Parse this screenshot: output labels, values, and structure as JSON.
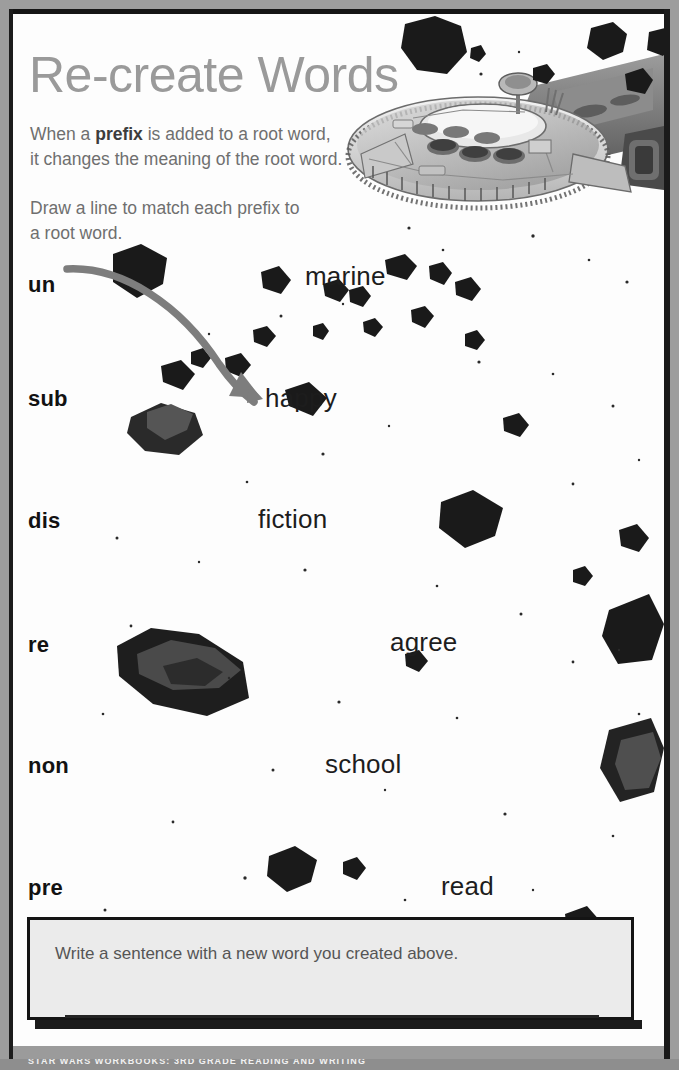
{
  "page": {
    "title": "Re-create Words",
    "intro_line_1": "When a ",
    "intro_bold": "prefix",
    "intro_line_1b": " is added to a root word,\nit changes the meaning of the root word.",
    "intro_line_2": "Draw a line to match each prefix to\na root word.",
    "footer": "STAR WARS WORKBOOKS: 3RD GRADE READING AND WRITING"
  },
  "exercise": {
    "prefixes": [
      {
        "label": "un",
        "top": 258
      },
      {
        "label": "sub",
        "top": 372
      },
      {
        "label": "dis",
        "top": 494
      },
      {
        "label": "re",
        "top": 618
      },
      {
        "label": "non",
        "top": 739
      },
      {
        "label": "pre",
        "top": 861
      }
    ],
    "roots": [
      {
        "label": "marine",
        "left": 292,
        "top": 247
      },
      {
        "label": "happy",
        "left": 252,
        "top": 369
      },
      {
        "label": "fiction",
        "left": 245,
        "top": 490
      },
      {
        "label": "agree",
        "left": 377,
        "top": 613
      },
      {
        "label": "school",
        "left": 312,
        "top": 735
      },
      {
        "label": "read",
        "left": 428,
        "top": 857
      }
    ],
    "drawn_match": {
      "from": "un",
      "to": "happy",
      "color": "#7d7d7d"
    }
  },
  "answer": {
    "prompt": "Write a sentence with a new word you created above.",
    "value": ""
  },
  "colors": {
    "title_gray": "#9a9a9a",
    "body_gray": "#6f6f6f",
    "ink_black": "#121212",
    "answer_fill": "#ebebeb",
    "frame_gray": "#9d9d9d"
  }
}
